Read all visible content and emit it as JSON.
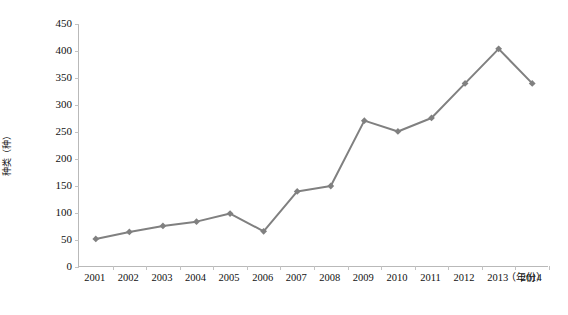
{
  "chart_data": {
    "type": "line",
    "title": "",
    "xlabel": "（年份）",
    "ylabel": "种类（种）",
    "categories": [
      "2001",
      "2002",
      "2003",
      "2004",
      "2005",
      "2006",
      "2007",
      "2008",
      "2009",
      "2010",
      "2011",
      "2012",
      "2013",
      "2014"
    ],
    "values": [
      52,
      65,
      76,
      84,
      99,
      66,
      140,
      150,
      271,
      251,
      276,
      340,
      404,
      340
    ],
    "series": [
      {
        "name": "种类（种）",
        "values": [
          52,
          65,
          76,
          84,
          99,
          66,
          140,
          150,
          271,
          251,
          276,
          340,
          404,
          340
        ]
      }
    ],
    "ylim": [
      0,
      450
    ],
    "ytick_labels": [
      "0",
      "50",
      "100",
      "150",
      "200",
      "250",
      "300",
      "350",
      "400",
      "450"
    ],
    "ytick_values": [
      0,
      50,
      100,
      150,
      200,
      250,
      300,
      350,
      400,
      450
    ],
    "grid": false,
    "legend": "none",
    "marker": "diamond",
    "line_color": "#808080",
    "marker_color": "#808080",
    "axis_color": "#b9b9b9"
  },
  "axis": {
    "y_title": "种类（种）",
    "x_unit": "（年份）"
  },
  "caption": {
    "text": ""
  }
}
